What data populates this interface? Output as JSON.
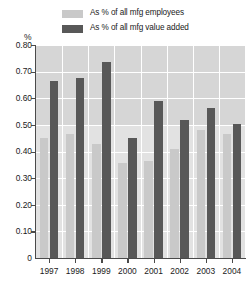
{
  "chart_data": {
    "type": "bar",
    "title": "",
    "subtitle": "",
    "xlabel": "",
    "ylabel": "%",
    "ylim": [
      0,
      0.8
    ],
    "ytick_labels": [
      "0.80",
      "0.70",
      "0.60",
      "0.50",
      "0.40",
      "0.30",
      "0.20",
      "0.10",
      "0"
    ],
    "ytick_values": [
      0.8,
      0.7,
      0.6,
      0.5,
      0.4,
      0.3,
      0.2,
      0.1,
      0
    ],
    "grid": true,
    "legend_position": "top",
    "categories": [
      "1997",
      "1998",
      "1999",
      "2000",
      "2001",
      "2002",
      "2003",
      "2004"
    ],
    "series": [
      {
        "name": "As % of all mfg employees",
        "color": "#c9c9c9",
        "values": [
          0.45,
          0.465,
          0.43,
          0.355,
          0.365,
          0.41,
          0.48,
          0.465
        ]
      },
      {
        "name": "As % of all mfg value added",
        "color": "#585858",
        "values": [
          0.665,
          0.675,
          0.735,
          0.45,
          0.59,
          0.52,
          0.565,
          0.505
        ]
      }
    ]
  },
  "colors": {
    "plot_background": "#e2e2e2",
    "plot_background_upper": "#d6d6d6",
    "gridline": "#ffffff",
    "axis": "#4a4a4a",
    "text": "#1a1a1a"
  }
}
